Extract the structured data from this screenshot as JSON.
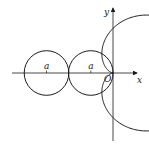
{
  "diagram": {
    "type": "cardioid-with-circles",
    "axes": {
      "x_label": "x",
      "y_label": "y",
      "origin_label": "O"
    },
    "circle_labels": [
      "a",
      "a"
    ],
    "colors": {
      "stroke": "#1a1a1a",
      "background": "#ffffff"
    }
  }
}
